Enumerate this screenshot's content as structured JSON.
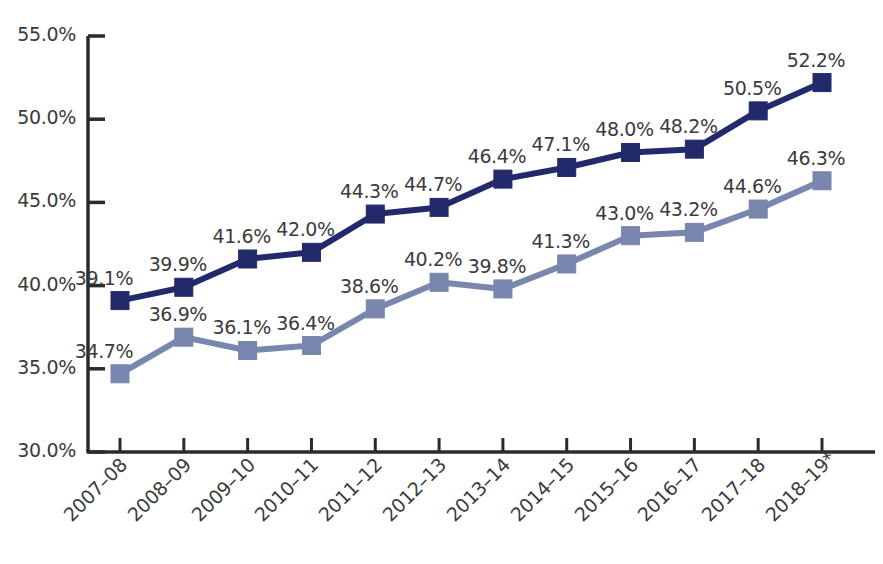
{
  "chart_data": {
    "type": "line",
    "title": "",
    "subtitle": "",
    "xlabel": "",
    "ylabel": "",
    "ylim": [
      30.0,
      55.0
    ],
    "ytick_labels": [
      "55.0%",
      "50.0%",
      "45.0%",
      "40.0%",
      "35.0%",
      "30.0%"
    ],
    "ytick_values": [
      55.0,
      50.0,
      45.0,
      40.0,
      35.0,
      30.0
    ],
    "grid": false,
    "legend": "none",
    "categories": [
      "2007–08",
      "2008–09",
      "2009–10",
      "2010–11",
      "2011–12",
      "2012–13",
      "2013–14",
      "2014–15",
      "2015–16",
      "2016–17",
      "2017–18",
      "2018–19*"
    ],
    "series": [
      {
        "name": "series-upper",
        "color": "#232a6b",
        "marker": "square",
        "values": [
          39.1,
          39.9,
          41.6,
          42.0,
          44.3,
          44.7,
          46.4,
          47.1,
          48.0,
          48.2,
          50.5,
          52.2
        ],
        "labels": [
          "39.1%",
          "39.9%",
          "41.6%",
          "42.0%",
          "44.3%",
          "44.7%",
          "46.4%",
          "47.1%",
          "48.0%",
          "48.2%",
          "50.5%",
          "52.2%"
        ]
      },
      {
        "name": "series-lower",
        "color": "#7986ad",
        "marker": "square",
        "values": [
          34.7,
          36.9,
          36.1,
          36.4,
          38.6,
          40.2,
          39.8,
          41.3,
          43.0,
          43.2,
          44.6,
          46.3
        ],
        "labels": [
          "34.7%",
          "36.9%",
          "36.1%",
          "36.4%",
          "38.6%",
          "40.2%",
          "39.8%",
          "41.3%",
          "43.0%",
          "43.2%",
          "44.6%",
          "46.3%"
        ]
      }
    ],
    "axis_color": "#2b2b2b",
    "text_color": "#3b3b3b",
    "background": "#ffffff",
    "footnote_marker": "*"
  }
}
